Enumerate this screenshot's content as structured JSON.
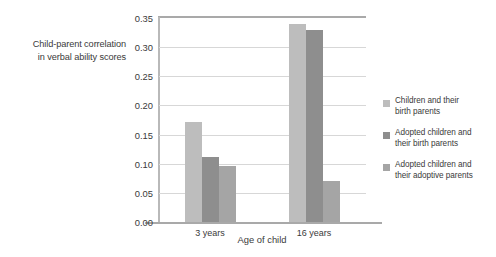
{
  "chart_data": {
    "type": "bar",
    "title": "",
    "xlabel": "Age of child",
    "ylabel": "Child-parent correlation in verbal ability scores",
    "ylabel_lines": [
      "Child-parent correlation",
      "in verbal ability scores"
    ],
    "categories": [
      "3 years",
      "16 years"
    ],
    "ylim": [
      0.0,
      0.35
    ],
    "yticks": [
      "0.00",
      "0.05",
      "0.10",
      "0.15",
      "0.20",
      "0.25",
      "0.30",
      "0.35"
    ],
    "ytick_values": [
      0.0,
      0.05,
      0.1,
      0.15,
      0.2,
      0.25,
      0.3,
      0.35
    ],
    "grid": true,
    "legend_position": "right",
    "series": [
      {
        "name": "Children and their birth parents",
        "name_lines": [
          "Children and their",
          "birth parents"
        ],
        "color": "#bdbdbd",
        "values": [
          0.172,
          0.34
        ]
      },
      {
        "name": "Adopted children and their birth parents",
        "name_lines": [
          "Adopted children and",
          "their birth parents"
        ],
        "color": "#8e8e8e",
        "values": [
          0.111,
          0.329
        ]
      },
      {
        "name": "Adopted children and their adoptive parents",
        "name_lines": [
          "Adopted children and",
          "their adoptive parents"
        ],
        "color": "#a5a5a5",
        "values": [
          0.096,
          0.07
        ]
      }
    ]
  },
  "colors": {
    "background": "#ffffff",
    "text": "#3a3a3a",
    "gridline": "#d7d7d7",
    "axis": "#a9a9a9"
  }
}
